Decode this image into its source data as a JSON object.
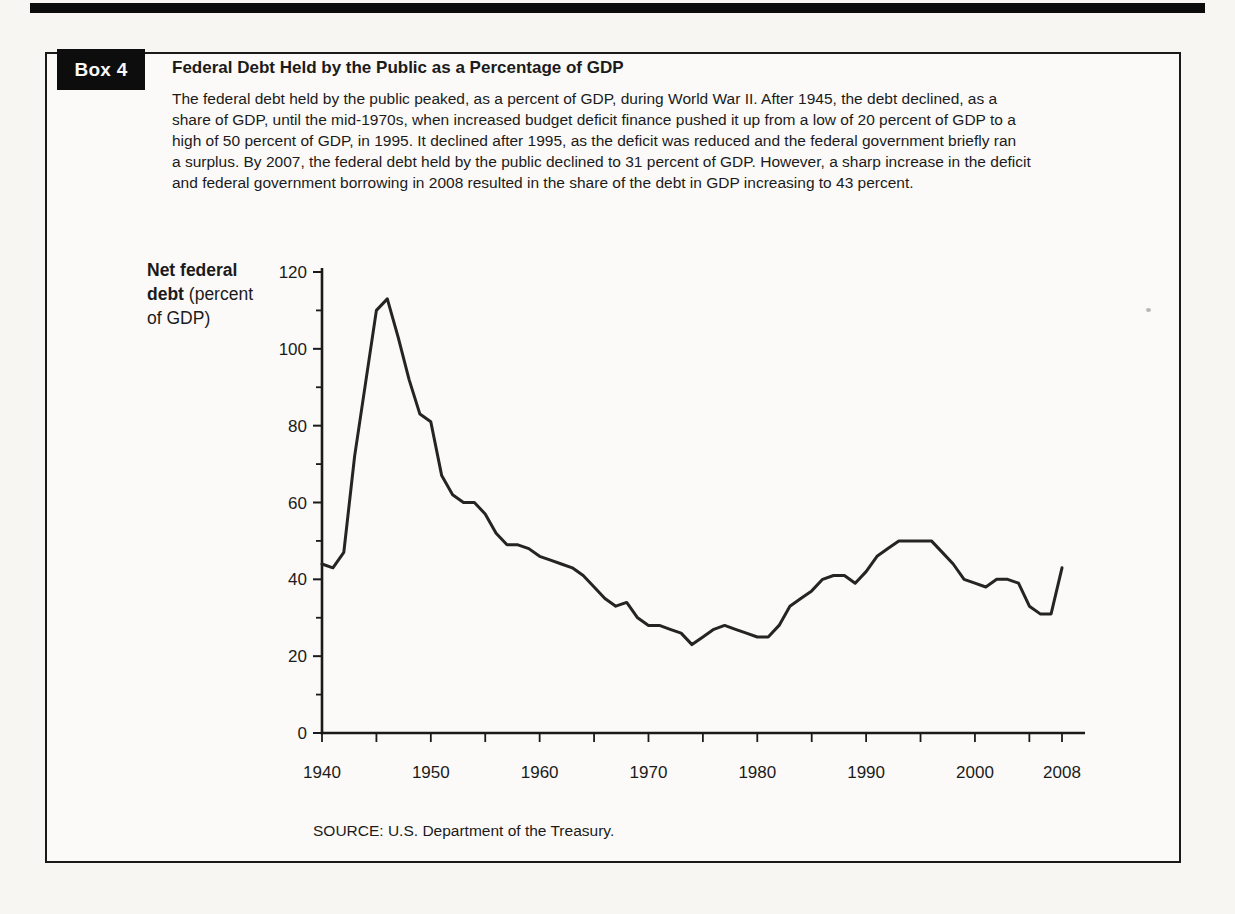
{
  "page": {
    "top_bar_color": "#0b0b0b"
  },
  "box": {
    "badge_label": "Box 4",
    "title": "Federal Debt Held by the Public as a Percentage of GDP",
    "paragraph_lines": [
      "The federal debt held by the public peaked, as a percent of GDP, during World War II. After 1945, the debt declined, as a",
      "share of GDP, until the mid-1970s, when increased budget deficit finance pushed it up from a low of 20 percent of GDP to a",
      "high of 50 percent of GDP, in 1995. It declined after 1995, as the deficit was reduced and the federal government briefly ran",
      "a surplus. By 2007, the federal debt held by the public declined to 31 percent of GDP.  However, a sharp increase in the deficit",
      "and federal government borrowing in 2008 resulted in the share of the debt in GDP increasing to 43 percent."
    ],
    "source_note": "SOURCE: U.S. Department of the Treasury."
  },
  "ylabel": {
    "line1_bold": "Net federal",
    "line2_bold": "debt",
    "line2_normal": " (percent",
    "line3_normal": "of GDP)"
  },
  "chart_data": {
    "type": "line",
    "title": "",
    "xlabel": "",
    "ylabel": "Net federal debt (percent of GDP)",
    "x_range": [
      1940,
      2008
    ],
    "ylim": [
      0,
      120
    ],
    "grid": false,
    "legend": "none",
    "y_major_ticks": [
      0,
      20,
      40,
      60,
      80,
      100,
      120
    ],
    "y_minor_ticks": [
      10,
      30,
      50,
      70,
      90,
      110
    ],
    "x_tick_years": [
      1940,
      1945,
      1950,
      1955,
      1960,
      1965,
      1970,
      1975,
      1980,
      1985,
      1990,
      1995,
      2000,
      2005,
      2008
    ],
    "x_labeled_ticks": [
      1940,
      1950,
      1960,
      1970,
      1980,
      1990,
      2000,
      2008
    ],
    "line_color": "#242424",
    "axis_color": "#1a1a1a",
    "series": [
      {
        "name": "Net federal debt (percent of GDP)",
        "x": [
          1940,
          1941,
          1942,
          1943,
          1944,
          1945,
          1946,
          1947,
          1948,
          1949,
          1950,
          1951,
          1952,
          1953,
          1954,
          1955,
          1956,
          1957,
          1958,
          1959,
          1960,
          1961,
          1962,
          1963,
          1964,
          1965,
          1966,
          1967,
          1968,
          1969,
          1970,
          1971,
          1972,
          1973,
          1974,
          1975,
          1976,
          1977,
          1978,
          1979,
          1980,
          1981,
          1982,
          1983,
          1984,
          1985,
          1986,
          1987,
          1988,
          1989,
          1990,
          1991,
          1992,
          1993,
          1994,
          1995,
          1996,
          1997,
          1998,
          1999,
          2000,
          2001,
          2002,
          2003,
          2004,
          2005,
          2006,
          2007,
          2008
        ],
        "values": [
          44,
          43,
          47,
          72,
          91,
          110,
          113,
          103,
          92,
          83,
          81,
          67,
          62,
          60,
          60,
          57,
          52,
          49,
          49,
          48,
          46,
          45,
          44,
          43,
          41,
          38,
          35,
          33,
          34,
          30,
          28,
          28,
          27,
          26,
          23,
          25,
          27,
          28,
          27,
          26,
          25,
          25,
          28,
          33,
          35,
          37,
          40,
          41,
          41,
          39,
          42,
          46,
          48,
          50,
          50,
          50,
          50,
          47,
          44,
          40,
          39,
          38,
          40,
          40,
          39,
          33,
          31,
          31,
          43
        ]
      }
    ]
  }
}
